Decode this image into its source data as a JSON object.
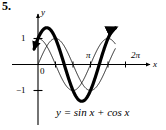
{
  "figure": {
    "problem_number": "5.",
    "equation": "y = sin x  +  cos x",
    "axis_labels": {
      "x": "x",
      "y": "y"
    },
    "tick_labels": {
      "y_one": "1",
      "y_neg_one": "−1",
      "origin": "0",
      "pi": "π",
      "two_pi": "2π"
    },
    "colors": {
      "ink": "#000000",
      "background": "#ffffff",
      "thin_curve": "#111111"
    }
  },
  "chart_data": {
    "type": "line",
    "title": "",
    "subtitle": "",
    "xlabel": "x",
    "ylabel": "y",
    "equation": "y = sin x + cos x",
    "xlim": [
      -0.45,
      7.35
    ],
    "ylim": [
      -1.85,
      1.85
    ],
    "grid": false,
    "legend": "none",
    "x_tick_values": [
      0,
      1.5708,
      3.14159,
      4.71239,
      6.28319
    ],
    "x_tick_labels": [
      "0",
      "",
      "π",
      "",
      "2π"
    ],
    "y_tick_values": [
      1,
      -1
    ],
    "y_tick_labels": [
      "1",
      "−1"
    ],
    "annotations": [
      {
        "text": "π",
        "x": 3.14159,
        "y": 0.32
      },
      {
        "text": "2π",
        "x": 6.28319,
        "y": 0.42
      },
      {
        "text": "0",
        "x": 0.0,
        "y": -0.3
      }
    ],
    "series": [
      {
        "name": "sin x + cos x",
        "style": "thick",
        "linewidth": 3.2,
        "arrow_start": true,
        "arrow_end": true,
        "amplitude": 1.41421,
        "phase": 0.7854,
        "x_start": -0.35,
        "x_end": 6.95,
        "key_points": [
          {
            "x": 0.0,
            "y": 1.0
          },
          {
            "x": 0.7854,
            "y": 1.41421
          },
          {
            "x": 2.35619,
            "y": 0.0
          },
          {
            "x": 3.92699,
            "y": -1.41421
          },
          {
            "x": 5.49779,
            "y": 0.0
          },
          {
            "x": 6.28319,
            "y": 1.0
          }
        ]
      },
      {
        "name": "sin x",
        "style": "thin",
        "linewidth": 0.9,
        "arrow_start": false,
        "arrow_end": false,
        "amplitude": 1.0,
        "phase": 0.0,
        "x_start": 0.0,
        "x_end": 6.95,
        "key_points": [
          {
            "x": 0.0,
            "y": 0.0
          },
          {
            "x": 1.5708,
            "y": 1.0
          },
          {
            "x": 3.14159,
            "y": 0.0
          },
          {
            "x": 4.71239,
            "y": -1.0
          },
          {
            "x": 6.28319,
            "y": 0.0
          }
        ]
      },
      {
        "name": "cos x",
        "style": "thin",
        "linewidth": 0.9,
        "arrow_start": false,
        "arrow_end": false,
        "amplitude": 1.0,
        "phase": 1.5708,
        "x_start": 0.0,
        "x_end": 6.95,
        "key_points": [
          {
            "x": 0.0,
            "y": 1.0
          },
          {
            "x": 1.5708,
            "y": 0.0
          },
          {
            "x": 3.14159,
            "y": -1.0
          },
          {
            "x": 4.71239,
            "y": 0.0
          },
          {
            "x": 6.28319,
            "y": 1.0
          }
        ]
      }
    ]
  }
}
